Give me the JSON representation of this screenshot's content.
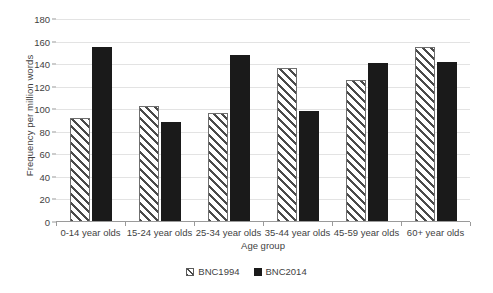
{
  "chart_data": {
    "type": "bar",
    "title": "",
    "xlabel": "Age group",
    "ylabel": "Frequency per million words",
    "categories": [
      "0-14 year olds",
      "15-24 year olds",
      "25-34 year olds",
      "35-44 year olds",
      "45-59 year olds",
      "60+ year olds"
    ],
    "series": [
      {
        "name": "BNC1994",
        "values": [
          92,
          103,
          97,
          137,
          126,
          155
        ],
        "color": "#ffffff",
        "pattern": "diagonal-hatch"
      },
      {
        "name": "BNC2014",
        "values": [
          155,
          89,
          148,
          98,
          141,
          142
        ],
        "color": "#1a1a1a",
        "pattern": "solid"
      }
    ],
    "ylim": [
      0,
      180
    ],
    "ytick_step": 20,
    "yticks": [
      0,
      20,
      40,
      60,
      80,
      100,
      120,
      140,
      160,
      180
    ],
    "ytick_labels": [
      "0",
      "20",
      "40",
      "60",
      "80",
      "100",
      "120",
      "140",
      "160",
      "180"
    ],
    "grid": true,
    "grid_axis": "y",
    "legend_position": "bottom-center"
  },
  "legend": {
    "items": [
      {
        "label": "BNC1994"
      },
      {
        "label": "BNC2014"
      }
    ]
  }
}
